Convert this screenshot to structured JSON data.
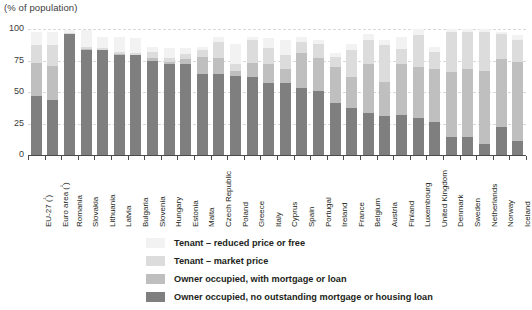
{
  "axis_title": "(% of population)",
  "legend": {
    "position": "bottom",
    "items": [
      {
        "label": "Tenant – reduced price or free",
        "color": "#f2f2f2",
        "key": "tenant_reduced_or_free"
      },
      {
        "label": "Tenant – market price",
        "color": "#dcdcdc",
        "key": "tenant_market"
      },
      {
        "label": "Owner occupied, with mortgage or loan",
        "color": "#bfbfbf",
        "key": "owner_mortgage"
      },
      {
        "label": "Owner occupied, no outstanding mortgage or housing loan",
        "color": "#7f7f7f",
        "key": "owner_no_mortgage"
      }
    ]
  },
  "yaxis": {
    "ticks": [
      "0",
      "25",
      "50",
      "75",
      "100"
    ],
    "min": 0,
    "max": 100
  },
  "chart_data": {
    "type": "bar",
    "subtype": "stacked-vertical",
    "title": "",
    "subtitle": "",
    "xlabel": "",
    "ylabel": "(% of population)",
    "ylim": [
      0,
      100
    ],
    "yticks": [
      0,
      25,
      50,
      75,
      100
    ],
    "grid": true,
    "legend_position": "bottom",
    "categories": [
      "EU-27 (²)",
      "Euro area (²)",
      "Romania",
      "Slovakia",
      "Lithuania",
      "Latvia",
      "Bulgaria",
      "Slovenia",
      "Hungary",
      "Estonia",
      "Malta",
      "Czech Republic",
      "Poland",
      "Greece",
      "Italy",
      "Cyprus",
      "Spain",
      "Portugal",
      "Ireland",
      "France",
      "Belgium",
      "Austria",
      "Finland",
      "Luxembourg",
      "United Kingdom",
      "Denmark",
      "Sweden",
      "Netherlands",
      "Norway",
      "Iceland"
    ],
    "series": [
      {
        "name": "Owner occupied, no outstanding mortgage or housing loan",
        "color": "#7f7f7f",
        "values": [
          47,
          44,
          96,
          83,
          83,
          79,
          79,
          75,
          72,
          72,
          64,
          64,
          63,
          62,
          57,
          57,
          53,
          51,
          41,
          37,
          33,
          31,
          32,
          29,
          26,
          14,
          14,
          9,
          22,
          11
        ]
      },
      {
        "name": "Owner occupied, with mortgage or loan",
        "color": "#bfbfbf",
        "values": [
          26,
          27,
          0,
          1,
          0,
          1,
          0,
          2,
          2,
          4,
          14,
          13,
          4,
          11,
          15,
          11,
          28,
          26,
          29,
          25,
          39,
          27,
          40,
          41,
          42,
          52,
          54,
          58,
          54,
          63
        ]
      },
      {
        "name": "Tenant – market price",
        "color": "#dcdcdc",
        "values": [
          14,
          16,
          1,
          2,
          2,
          2,
          2,
          5,
          3,
          4,
          5,
          13,
          5,
          18,
          13,
          11,
          9,
          11,
          8,
          21,
          19,
          29,
          12,
          25,
          14,
          32,
          30,
          31,
          20,
          17
        ]
      },
      {
        "name": "Tenant – reduced price or free",
        "color": "#f2f2f2",
        "values": [
          11,
          11,
          2,
          13,
          9,
          12,
          12,
          4,
          8,
          5,
          3,
          4,
          16,
          3,
          8,
          12,
          4,
          3,
          3,
          5,
          5,
          4,
          10,
          5,
          4,
          2,
          2,
          2,
          2,
          4
        ]
      }
    ],
    "bar_totals": [
      98,
      98,
      99,
      99,
      94,
      94,
      93,
      86,
      85,
      85,
      86,
      94,
      88,
      94,
      93,
      91,
      94,
      91,
      81,
      88,
      96,
      91,
      94,
      100,
      86,
      100,
      100,
      100,
      98,
      95
    ]
  }
}
